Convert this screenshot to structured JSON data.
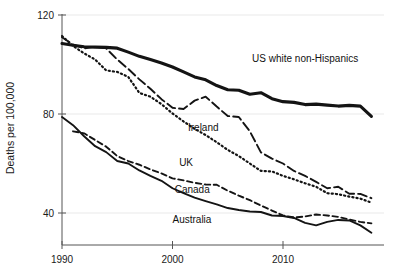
{
  "chart_data": {
    "type": "line",
    "title": "",
    "subtitle": "",
    "xlabel": "",
    "ylabel": "Deaths per 100,000",
    "xlim": [
      1989.0,
      2018.6
    ],
    "ylim": [
      26,
      124
    ],
    "yticks": [
      40,
      80,
      120
    ],
    "ytick_labels": [
      "40",
      "80",
      "120"
    ],
    "xticks": [
      1990,
      2000,
      2010
    ],
    "xtick_labels": [
      "1990",
      "2000",
      "2010"
    ],
    "grid": false,
    "legend_position": "inline-annotations",
    "series": [
      {
        "name": "US white non-Hispanics",
        "label": "US white non-Hispanics",
        "style": "solid-thick",
        "stroke_width": 3.1,
        "dash": "none",
        "label_x": 2007.2,
        "label_y": 101,
        "x": [
          1990,
          1991,
          1992,
          1993,
          1994,
          1995,
          1996,
          1997,
          1998,
          1999,
          2000,
          2001,
          2002,
          2003,
          2004,
          2005,
          2006,
          2007,
          2008,
          2009,
          2010,
          2011,
          2012,
          2013,
          2014,
          2015,
          2016,
          2017,
          2018
        ],
        "y": [
          108.5,
          107.8,
          107.2,
          107.0,
          106.9,
          106.6,
          105.0,
          103.3,
          102.0,
          100.6,
          99.0,
          97.0,
          95.0,
          93.8,
          91.5,
          89.8,
          89.6,
          88.0,
          88.6,
          86.2,
          85.0,
          84.7,
          83.8,
          84.0,
          83.6,
          83.2,
          83.5,
          83.2,
          79.0
        ]
      },
      {
        "name": "Ireland",
        "label": "Ireland",
        "style": "long-dash",
        "stroke_width": 1.9,
        "dash": "9,4",
        "label_x": 2001.4,
        "label_y": 73,
        "x": [
          1990,
          1991,
          1992,
          1993,
          1994,
          1995,
          1996,
          1997,
          1998,
          1999,
          2000,
          2001,
          2002,
          2003,
          2004,
          2005,
          2006,
          2007,
          2008,
          2009,
          2010,
          2011,
          2012,
          2013,
          2014,
          2015,
          2016,
          2017,
          2018
        ],
        "y": [
          111.0,
          108.0,
          106.5,
          107.2,
          106.5,
          102.0,
          98.2,
          94.0,
          90.2,
          86.0,
          82.5,
          82.0,
          85.4,
          87.0,
          83.0,
          79.2,
          78.8,
          73.0,
          64.5,
          62.0,
          60.0,
          57.0,
          55.0,
          52.6,
          50.0,
          50.6,
          47.8,
          47.7,
          46.0
        ]
      },
      {
        "name": "UK",
        "label": "UK",
        "style": "dotted",
        "stroke_width": 2.2,
        "dash": "1.2,3.0",
        "label_x": 2000.6,
        "label_y": 59,
        "x": [
          1990,
          1991,
          1992,
          1993,
          1994,
          1995,
          1996,
          1997,
          1998,
          1999,
          2000,
          2001,
          2002,
          2003,
          2004,
          2005,
          2006,
          2007,
          2008,
          2009,
          2010,
          2011,
          2012,
          2013,
          2014,
          2015,
          2016,
          2017,
          2018
        ],
        "y": [
          111.5,
          107.5,
          104.5,
          102.0,
          97.6,
          97.0,
          95.0,
          88.5,
          87.0,
          84.0,
          80.2,
          77.0,
          74.0,
          71.5,
          68.6,
          65.5,
          63.0,
          60.0,
          57.0,
          56.8,
          55.0,
          53.6,
          52.0,
          50.6,
          48.0,
          47.6,
          46.6,
          45.8,
          44.2
        ]
      },
      {
        "name": "Canada",
        "label": "Canada",
        "style": "short-dash",
        "stroke_width": 1.9,
        "dash": "5.5,3.5",
        "label_x": 2000.2,
        "label_y": 48,
        "x": [
          1991,
          1992,
          1993,
          1994,
          1995,
          1996,
          1997,
          1998,
          1999,
          2000,
          2001,
          2002,
          2003,
          2004,
          2005,
          2006,
          2007,
          2008,
          2009,
          2010,
          2011,
          2012,
          2013,
          2014,
          2015,
          2016,
          2017,
          2018
        ],
        "y": [
          73.0,
          72.2,
          69.5,
          66.8,
          63.0,
          61.0,
          59.5,
          57.6,
          56.0,
          54.0,
          53.2,
          52.2,
          51.5,
          51.4,
          49.0,
          47.0,
          45.2,
          43.0,
          41.0,
          39.0,
          38.2,
          38.6,
          39.4,
          39.0,
          38.4,
          37.4,
          36.4,
          35.8
        ]
      },
      {
        "name": "Australia",
        "label": "Australia",
        "style": "solid-thin",
        "stroke_width": 1.9,
        "dash": "none",
        "label_x": 2000.0,
        "label_y": 36,
        "x": [
          1990,
          1991,
          1992,
          1993,
          1994,
          1995,
          1996,
          1997,
          1998,
          1999,
          2000,
          2001,
          2002,
          2003,
          2004,
          2005,
          2006,
          2007,
          2008,
          2009,
          2010,
          2011,
          2012,
          2013,
          2014,
          2015,
          2016,
          2017,
          2018
        ],
        "y": [
          78.8,
          75.5,
          71.0,
          67.0,
          64.6,
          61.0,
          60.0,
          57.2,
          55.0,
          53.0,
          50.0,
          48.0,
          46.2,
          44.8,
          43.5,
          42.0,
          41.2,
          40.6,
          40.4,
          39.0,
          38.8,
          38.0,
          36.0,
          35.0,
          36.4,
          37.2,
          37.0,
          35.0,
          32.0
        ]
      }
    ]
  }
}
